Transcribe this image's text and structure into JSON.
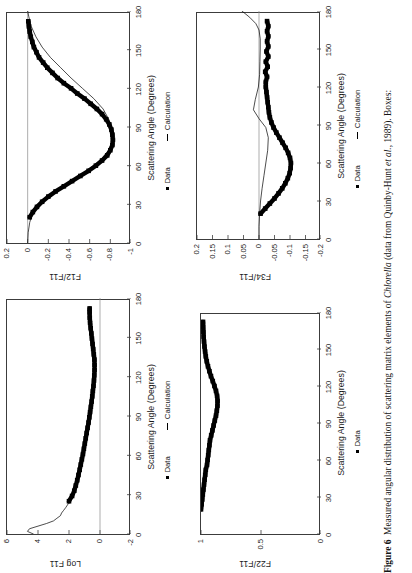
{
  "caption": {
    "label": "Figure 6",
    "text_before_species": "Measured angular distribution of scattering matrix elements of ",
    "species": "Chlorella",
    "text_after_species": " (data from Quinby-Hunt ",
    "etal": "et al.",
    "text_tail": ", 1989). Boxes:"
  },
  "legend": {
    "data_label": "Data",
    "calculation_label": "Calculation",
    "data_marker": "filled-square-marker",
    "calculation_marker": "line-marker"
  },
  "common": {
    "xlabel": "Scattering Angle (Degrees)",
    "xticks": [
      "0",
      "30",
      "60",
      "90",
      "120",
      "150",
      "180"
    ]
  },
  "chart_data": [
    {
      "id": "f12",
      "type": "line",
      "title": "",
      "ylabel": "F12/F11",
      "xlabel": "Scattering Angle (Degrees)",
      "xlim": [
        0,
        180
      ],
      "ylim": [
        -1,
        0.2
      ],
      "xticks": [
        0,
        30,
        60,
        90,
        120,
        150,
        180
      ],
      "yticks": [
        0.2,
        0,
        -0.2,
        -0.4,
        -0.6,
        -0.8,
        -1
      ],
      "ytick_labels": [
        "0.2",
        "0",
        "-0.2",
        "-0.4",
        "-0.6",
        "-0.8",
        "-1"
      ],
      "grid": false,
      "legend": [
        "Data",
        "Calculation"
      ],
      "legend_position": "below-axis",
      "series": [
        {
          "name": "Data",
          "style": "filled-squares",
          "x": [
            20,
            24,
            28,
            32,
            36,
            40,
            44,
            48,
            52,
            56,
            60,
            64,
            68,
            72,
            76,
            80,
            84,
            88,
            92,
            96,
            100,
            104,
            108,
            112,
            116,
            120,
            124,
            128,
            132,
            136,
            140,
            144,
            148,
            152,
            156,
            160,
            164,
            168,
            172
          ],
          "y": [
            -0.02,
            -0.05,
            -0.09,
            -0.14,
            -0.2,
            -0.27,
            -0.35,
            -0.43,
            -0.51,
            -0.59,
            -0.66,
            -0.72,
            -0.77,
            -0.8,
            -0.82,
            -0.825,
            -0.82,
            -0.81,
            -0.79,
            -0.76,
            -0.72,
            -0.67,
            -0.61,
            -0.55,
            -0.48,
            -0.42,
            -0.35,
            -0.29,
            -0.24,
            -0.19,
            -0.15,
            -0.11,
            -0.085,
            -0.06,
            -0.045,
            -0.03,
            -0.02,
            -0.012,
            -0.006
          ]
        },
        {
          "name": "Calculation",
          "style": "thin-line",
          "x": [
            0,
            8,
            16,
            24,
            32,
            40,
            48,
            56,
            64,
            72,
            80,
            88,
            96,
            104,
            112,
            120,
            128,
            136,
            144,
            152,
            160,
            168,
            176,
            180
          ],
          "y": [
            0.0,
            -0.005,
            -0.02,
            -0.05,
            -0.13,
            -0.26,
            -0.42,
            -0.57,
            -0.7,
            -0.785,
            -0.82,
            -0.815,
            -0.785,
            -0.73,
            -0.64,
            -0.53,
            -0.42,
            -0.32,
            -0.22,
            -0.14,
            -0.08,
            -0.035,
            -0.01,
            0.0
          ]
        }
      ]
    },
    {
      "id": "f34",
      "type": "line",
      "title": "",
      "ylabel": "F34/F11",
      "xlabel": "Scattering Angle (Degrees)",
      "xlim": [
        0,
        180
      ],
      "ylim": [
        -0.2,
        0.2
      ],
      "xticks": [
        0,
        30,
        60,
        90,
        120,
        150,
        180
      ],
      "yticks": [
        0.2,
        0.15,
        0.1,
        0.05,
        0,
        -0.05,
        -0.1,
        -0.15,
        -0.2
      ],
      "ytick_labels": [
        "0.2",
        "0.15",
        "0.1",
        "0.05",
        "0",
        "-0.05",
        "-0.1",
        "-0.15",
        "-0.2"
      ],
      "grid": false,
      "legend": [
        "Data",
        "Calculation"
      ],
      "legend_position": "below-axis",
      "series": [
        {
          "name": "Data",
          "style": "filled-squares",
          "x": [
            20,
            24,
            28,
            32,
            36,
            40,
            44,
            48,
            52,
            56,
            60,
            64,
            68,
            72,
            76,
            80,
            84,
            88,
            92,
            96,
            100,
            104,
            108,
            112,
            116,
            120,
            124,
            128,
            132,
            136,
            140,
            144,
            148,
            152,
            156,
            160,
            164,
            168,
            172
          ],
          "y": [
            -0.005,
            -0.02,
            -0.035,
            -0.05,
            -0.063,
            -0.075,
            -0.085,
            -0.093,
            -0.099,
            -0.102,
            -0.103,
            -0.1,
            -0.094,
            -0.086,
            -0.076,
            -0.066,
            -0.056,
            -0.047,
            -0.04,
            -0.035,
            -0.032,
            -0.03,
            -0.028,
            -0.026,
            -0.024,
            -0.022,
            -0.022,
            -0.026,
            -0.02,
            -0.028,
            -0.022,
            -0.03,
            -0.024,
            -0.03,
            -0.026,
            -0.03,
            -0.026,
            -0.03,
            -0.026
          ]
        },
        {
          "name": "Calculation",
          "style": "thin-line",
          "x": [
            0,
            10,
            20,
            30,
            40,
            50,
            60,
            70,
            80,
            88,
            95,
            102,
            110,
            120,
            130,
            140,
            150,
            158,
            165,
            170,
            175,
            180
          ],
          "y": [
            0.0,
            0.0,
            -0.002,
            -0.005,
            -0.01,
            -0.016,
            -0.022,
            -0.028,
            -0.03,
            -0.022,
            0.0,
            0.018,
            0.012,
            0.002,
            -0.002,
            -0.003,
            -0.004,
            -0.004,
            0.0,
            0.01,
            0.03,
            0.055
          ]
        }
      ]
    },
    {
      "id": "logf11",
      "type": "line",
      "title": "",
      "ylabel": "Log F11",
      "xlabel": "Scattering Angle (Degrees)",
      "xlim": [
        0,
        180
      ],
      "ylim": [
        -2,
        6
      ],
      "xticks": [
        0,
        30,
        60,
        90,
        120,
        150,
        180
      ],
      "yticks": [
        6,
        4,
        2,
        0,
        -2
      ],
      "ytick_labels": [
        "6",
        "4",
        "2",
        "0",
        "-2"
      ],
      "grid": false,
      "legend": [
        "Data",
        "Calculation"
      ],
      "legend_position": "below-axis",
      "series": [
        {
          "name": "Data",
          "style": "filled-squares",
          "x": [
            25,
            29,
            33,
            37,
            41,
            45,
            49,
            53,
            57,
            61,
            65,
            69,
            73,
            77,
            81,
            85,
            89,
            93,
            97,
            101,
            105,
            109,
            113,
            117,
            121,
            125,
            129,
            133,
            137,
            141,
            145,
            149,
            153,
            157,
            161,
            165,
            169,
            172
          ],
          "y": [
            2.0,
            1.8,
            1.66,
            1.56,
            1.47,
            1.39,
            1.31,
            1.24,
            1.17,
            1.1,
            1.04,
            0.98,
            0.92,
            0.86,
            0.8,
            0.74,
            0.69,
            0.64,
            0.59,
            0.54,
            0.5,
            0.46,
            0.42,
            0.39,
            0.37,
            0.35,
            0.35,
            0.36,
            0.4,
            0.44,
            0.48,
            0.52,
            0.56,
            0.6,
            0.64,
            0.66,
            0.67,
            0.67
          ]
        },
        {
          "name": "Calculation",
          "style": "thin-line",
          "x": [
            0,
            2,
            4,
            6,
            8,
            10,
            12,
            14,
            16,
            18,
            20,
            23,
            25,
            30,
            40,
            55,
            70,
            85,
            100,
            115,
            125,
            135,
            145,
            155,
            165,
            172
          ],
          "y": [
            4.3,
            4.68,
            4.55,
            4.0,
            3.45,
            3.0,
            2.78,
            2.55,
            2.48,
            2.35,
            2.22,
            2.05,
            2.0,
            1.8,
            1.48,
            1.18,
            0.93,
            0.74,
            0.56,
            0.4,
            0.35,
            0.37,
            0.47,
            0.57,
            0.66,
            0.67
          ]
        }
      ]
    },
    {
      "id": "f22",
      "type": "line",
      "title": "",
      "ylabel": "F22/F11",
      "xlabel": "Scattering Angle (Degrees)",
      "xlim": [
        0,
        180
      ],
      "ylim": [
        0,
        1
      ],
      "xticks": [
        0,
        30,
        60,
        90,
        120,
        150,
        180
      ],
      "yticks": [
        1,
        0.5,
        0
      ],
      "ytick_labels": [
        "1",
        "0.5",
        "0"
      ],
      "grid": false,
      "legend": [
        "Data"
      ],
      "legend_position": "below-axis",
      "series": [
        {
          "name": "Data",
          "style": "filled-squares",
          "x": [
            20,
            24,
            28,
            32,
            36,
            40,
            44,
            48,
            52,
            56,
            60,
            64,
            68,
            72,
            76,
            80,
            84,
            88,
            92,
            96,
            100,
            104,
            108,
            112,
            116,
            120,
            124,
            128,
            132,
            136,
            140,
            144,
            148,
            152,
            156,
            160,
            164,
            168,
            172
          ],
          "y": [
            1.0,
            0.995,
            0.99,
            0.985,
            0.98,
            0.975,
            0.97,
            0.965,
            0.96,
            0.95,
            0.945,
            0.94,
            0.935,
            0.93,
            0.925,
            0.915,
            0.905,
            0.895,
            0.885,
            0.875,
            0.868,
            0.863,
            0.862,
            0.866,
            0.875,
            0.888,
            0.902,
            0.917,
            0.93,
            0.942,
            0.952,
            0.96,
            0.966,
            0.971,
            0.975,
            0.978,
            0.98,
            0.982,
            0.983
          ]
        }
      ]
    }
  ]
}
